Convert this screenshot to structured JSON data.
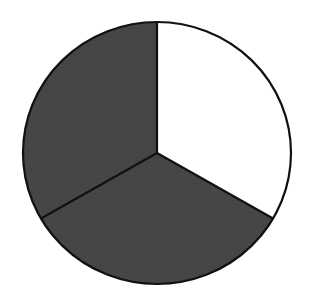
{
  "diagram": {
    "type": "fraction-circle",
    "parts_total": 3,
    "parts_shaded": 2,
    "fraction_shaded": "2/3",
    "center": [
      157,
      153
    ],
    "radius_x": 134,
    "radius_y": 131,
    "divider_angles_deg": [
      -90,
      30,
      150
    ],
    "sectors": [
      {
        "name": "top-right",
        "start_deg": -90,
        "end_deg": 30,
        "shaded": false
      },
      {
        "name": "bottom",
        "start_deg": 30,
        "end_deg": 150,
        "shaded": true
      },
      {
        "name": "top-left",
        "start_deg": 150,
        "end_deg": 270,
        "shaded": true
      }
    ],
    "colors": {
      "shaded_fill": "#4a4a4a",
      "unshaded_fill": "#ffffff",
      "stroke": "#111111",
      "background": "#ffffff"
    },
    "stroke_width": 2.2
  },
  "chart_data": {
    "type": "pie",
    "categories": [
      "unshaded",
      "shaded",
      "shaded"
    ],
    "values": [
      1,
      1,
      1
    ],
    "title": "",
    "shaded_fraction": "2/3",
    "legend": "none"
  }
}
